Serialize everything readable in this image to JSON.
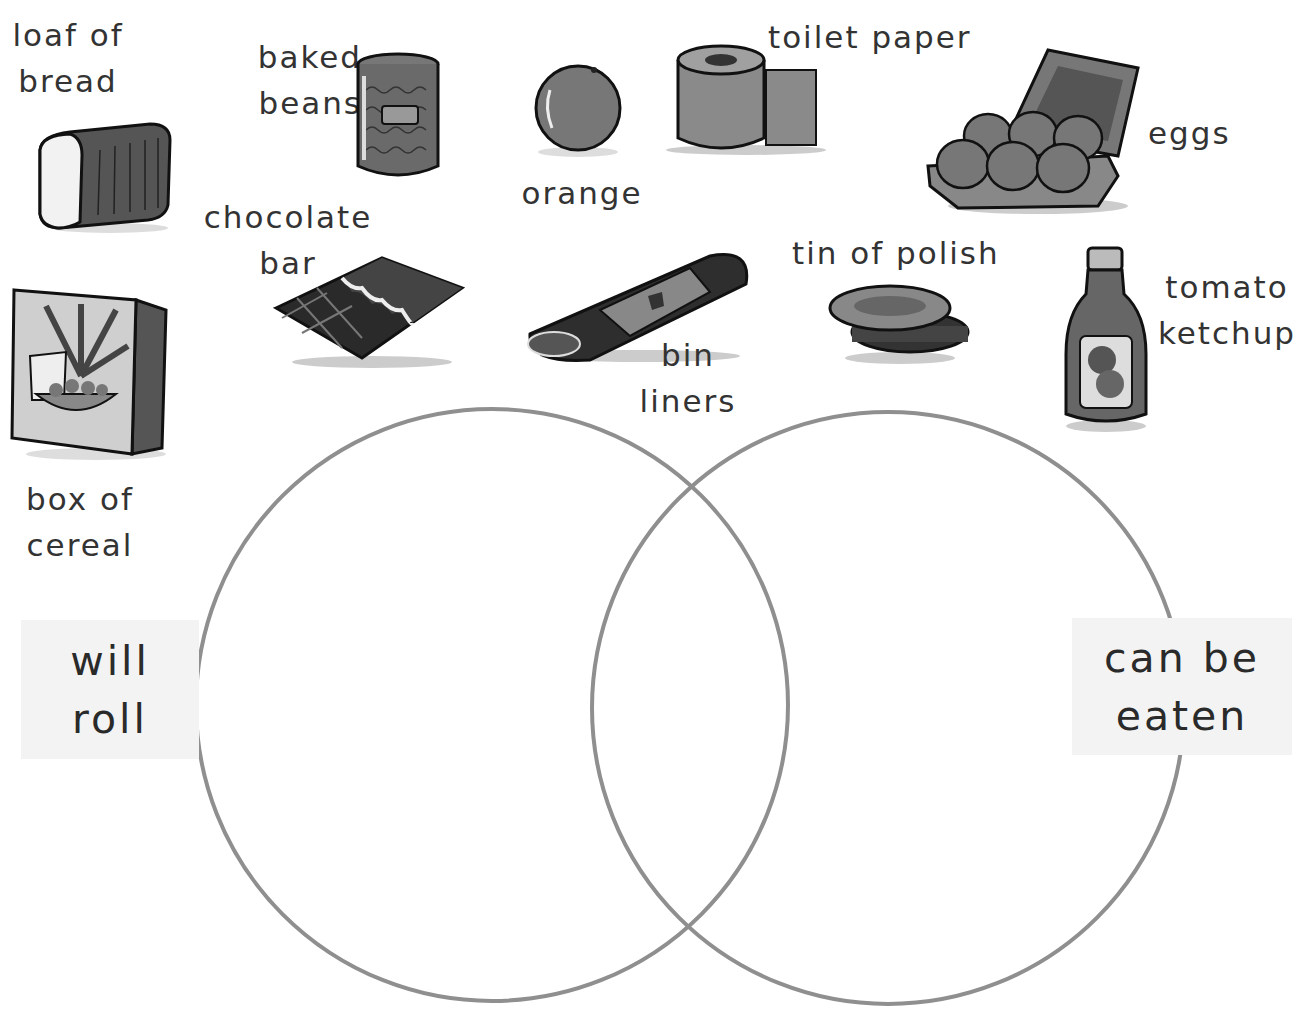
{
  "title_fragment": "",
  "items": [
    {
      "id": "loaf-of-bread",
      "label": "loaf of\nbread"
    },
    {
      "id": "baked-beans",
      "label": "baked\nbeans"
    },
    {
      "id": "orange",
      "label": "orange"
    },
    {
      "id": "toilet-paper",
      "label": "toilet paper"
    },
    {
      "id": "eggs",
      "label": "eggs"
    },
    {
      "id": "chocolate-bar",
      "label": "chocolate\nbar"
    },
    {
      "id": "bin-liners",
      "label": "bin\nliners"
    },
    {
      "id": "tin-of-polish",
      "label": "tin of polish"
    },
    {
      "id": "tomato-ketchup",
      "label": "tomato\nketchup"
    },
    {
      "id": "box-of-cereal",
      "label": "box of\ncereal"
    }
  ],
  "venn": {
    "left_set": {
      "label": "will\nroll",
      "circle_color": "#8f8f8f"
    },
    "right_set": {
      "label": "can be\neaten",
      "circle_color": "#8f8f8f"
    },
    "label_bg": "#f3f3f3"
  }
}
